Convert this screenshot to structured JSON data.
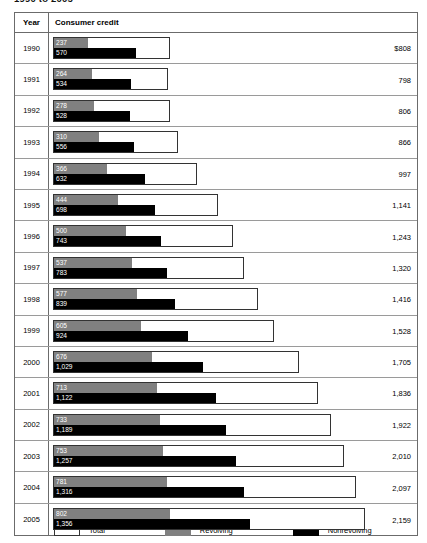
{
  "title": "1990 to 2005",
  "table": {
    "headers": {
      "year": "Year",
      "plot": "Consumer credit"
    }
  },
  "legend": [
    {
      "key": "total",
      "label": "Total",
      "color": "#ffffff"
    },
    {
      "key": "revolving",
      "label": "Revolving",
      "color": "#808080"
    },
    {
      "key": "nonrevolving",
      "label": "Nonrevolving",
      "color": "#000000"
    }
  ],
  "chart_data": {
    "type": "bar",
    "title": "1990 to 2005",
    "xlabel": "",
    "ylabel": "Year",
    "orientation": "horizontal",
    "stacked_display": "overlaid",
    "grid": false,
    "legend_position": "bottom",
    "xlim": [
      0,
      2200
    ],
    "categories": [
      "1990",
      "1991",
      "1992",
      "1993",
      "1994",
      "1995",
      "1996",
      "1997",
      "1998",
      "1999",
      "2000",
      "2001",
      "2002",
      "2003",
      "2004",
      "2005"
    ],
    "series": [
      {
        "name": "Total",
        "values": [
          808,
          798,
          806,
          866,
          997,
          1141,
          1243,
          1320,
          1416,
          1528,
          1705,
          1836,
          1922,
          2010,
          2097,
          2159
        ]
      },
      {
        "name": "Revolving",
        "values": [
          237,
          264,
          278,
          310,
          366,
          444,
          500,
          537,
          577,
          605,
          676,
          713,
          733,
          753,
          781,
          802
        ]
      },
      {
        "name": "Nonrevolving",
        "values": [
          570,
          534,
          528,
          556,
          632,
          698,
          743,
          783,
          839,
          924,
          1029,
          1122,
          1189,
          1257,
          1316,
          1356
        ]
      }
    ],
    "rows": [
      {
        "year": "1990",
        "revolving": "237",
        "nonrevolving": "570",
        "total": "$808",
        "revolving_value": 237,
        "nonrevolving_value": 570,
        "total_value": 808
      },
      {
        "year": "1991",
        "revolving": "264",
        "nonrevolving": "534",
        "total": "798",
        "revolving_value": 264,
        "nonrevolving_value": 534,
        "total_value": 798
      },
      {
        "year": "1992",
        "revolving": "278",
        "nonrevolving": "528",
        "total": "806",
        "revolving_value": 278,
        "nonrevolving_value": 528,
        "total_value": 806
      },
      {
        "year": "1993",
        "revolving": "310",
        "nonrevolving": "556",
        "total": "866",
        "revolving_value": 310,
        "nonrevolving_value": 556,
        "total_value": 866
      },
      {
        "year": "1994",
        "revolving": "366",
        "nonrevolving": "632",
        "total": "997",
        "revolving_value": 366,
        "nonrevolving_value": 632,
        "total_value": 997
      },
      {
        "year": "1995",
        "revolving": "444",
        "nonrevolving": "698",
        "total": "1,141",
        "revolving_value": 444,
        "nonrevolving_value": 698,
        "total_value": 1141
      },
      {
        "year": "1996",
        "revolving": "500",
        "nonrevolving": "743",
        "total": "1,243",
        "revolving_value": 500,
        "nonrevolving_value": 743,
        "total_value": 1243
      },
      {
        "year": "1997",
        "revolving": "537",
        "nonrevolving": "783",
        "total": "1,320",
        "revolving_value": 537,
        "nonrevolving_value": 783,
        "total_value": 1320
      },
      {
        "year": "1998",
        "revolving": "577",
        "nonrevolving": "839",
        "total": "1,416",
        "revolving_value": 577,
        "nonrevolving_value": 839,
        "total_value": 1416
      },
      {
        "year": "1999",
        "revolving": "605",
        "nonrevolving": "924",
        "total": "1,528",
        "revolving_value": 605,
        "nonrevolving_value": 924,
        "total_value": 1528
      },
      {
        "year": "2000",
        "revolving": "676",
        "nonrevolving": "1,029",
        "total": "1,705",
        "revolving_value": 676,
        "nonrevolving_value": 1029,
        "total_value": 1705
      },
      {
        "year": "2001",
        "revolving": "713",
        "nonrevolving": "1,122",
        "total": "1,836",
        "revolving_value": 713,
        "nonrevolving_value": 1122,
        "total_value": 1836
      },
      {
        "year": "2002",
        "revolving": "733",
        "nonrevolving": "1,189",
        "total": "1,922",
        "revolving_value": 733,
        "nonrevolving_value": 1189,
        "total_value": 1922
      },
      {
        "year": "2003",
        "revolving": "753",
        "nonrevolving": "1,257",
        "total": "2,010",
        "revolving_value": 753,
        "nonrevolving_value": 1257,
        "total_value": 2010
      },
      {
        "year": "2004",
        "revolving": "781",
        "nonrevolving": "1,316",
        "total": "2,097",
        "revolving_value": 781,
        "nonrevolving_value": 1316,
        "total_value": 2097
      },
      {
        "year": "2005",
        "revolving": "802",
        "nonrevolving": "1,356",
        "total": "2,159",
        "revolving_value": 802,
        "nonrevolving_value": 1356,
        "total_value": 2159
      }
    ]
  }
}
